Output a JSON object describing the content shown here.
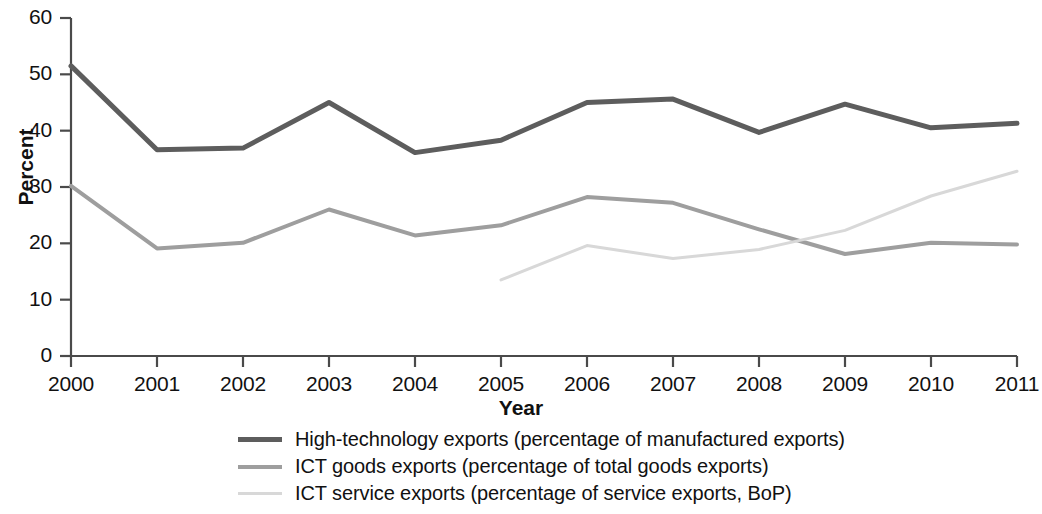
{
  "chart_data": {
    "type": "line",
    "title": "",
    "xlabel": "Year",
    "ylabel": "Percent",
    "categories": [
      "2000",
      "2001",
      "2002",
      "2003",
      "2004",
      "2005",
      "2006",
      "2007",
      "2008",
      "2009",
      "2010",
      "2011"
    ],
    "x": [
      2000,
      2001,
      2002,
      2003,
      2004,
      2005,
      2006,
      2007,
      2008,
      2009,
      2010,
      2011
    ],
    "xlim": [
      2000,
      2011
    ],
    "ylim": [
      0,
      60
    ],
    "yticks": [
      0,
      10,
      20,
      30,
      40,
      50,
      60
    ],
    "grid": false,
    "legend_position": "bottom",
    "series": [
      {
        "name": "High-technology exports (percentage of manufactured exports)",
        "color": "#5d5d5d",
        "width": 5,
        "values": [
          51.5,
          36.6,
          36.9,
          45.0,
          36.1,
          38.3,
          45.0,
          45.6,
          39.7,
          44.7,
          40.5,
          41.3
        ]
      },
      {
        "name": "ICT goods exports (percentage of total goods exports)",
        "color": "#9e9e9e",
        "width": 4,
        "values": [
          30.2,
          19.1,
          20.1,
          26.0,
          21.4,
          23.2,
          28.2,
          27.2,
          22.5,
          18.1,
          20.1,
          19.8
        ]
      },
      {
        "name": "ICT service exports (percentage of service exports, BoP)",
        "color": "#d8d8d8",
        "width": 3,
        "values": [
          null,
          null,
          null,
          null,
          null,
          13.5,
          19.6,
          17.3,
          18.9,
          22.3,
          28.4,
          32.8
        ]
      }
    ]
  },
  "axes": {
    "y_title": "Percent",
    "x_title": "Year",
    "y_tick_labels": [
      "60",
      "50",
      "40",
      "30",
      "20",
      "10",
      "0"
    ],
    "x_tick_labels": [
      "2000",
      "2001",
      "2002",
      "2003",
      "2004",
      "2005",
      "2006",
      "2007",
      "2008",
      "2009",
      "2010",
      "2011"
    ],
    "axis_color": "#4a4a4a"
  },
  "legend": {
    "entries": [
      {
        "label": "High-technology exports (percentage of manufactured exports)",
        "color": "#5d5d5d"
      },
      {
        "label": "ICT goods exports (percentage of total goods exports)",
        "color": "#9e9e9e"
      },
      {
        "label": "ICT service exports (percentage of service exports, BoP)",
        "color": "#d8d8d8"
      }
    ]
  }
}
